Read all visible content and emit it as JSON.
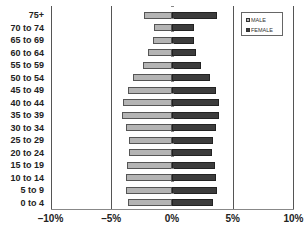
{
  "chart_data": {
    "type": "bar",
    "orientation": "horizontal",
    "subtype": "population-pyramid",
    "title": "",
    "xlabel": "",
    "ylabel": "",
    "xlim": [
      -10,
      10
    ],
    "x_ticks": [
      -10,
      -5,
      0,
      5,
      10
    ],
    "x_tick_labels": [
      "–10%",
      "–5%",
      "0%",
      "5%",
      "10%"
    ],
    "grid": {
      "vertical": true,
      "positions": [
        -10,
        -5,
        5
      ]
    },
    "legend_position": "top-right",
    "categories": [
      "75+",
      "70 to 74",
      "65 to 69",
      "60 to 64",
      "55 to 59",
      "50 to 54",
      "45 to 49",
      "40 to 44",
      "35 to 39",
      "30 to 34",
      "25 to 29",
      "20 to 24",
      "15 to 19",
      "10 to 14",
      "5 to 9",
      "0 to 4"
    ],
    "series": [
      {
        "name": "MALE",
        "color": "#b4b4b4",
        "side": "left",
        "values": [
          2.3,
          1.5,
          1.6,
          2.0,
          2.4,
          3.2,
          3.6,
          4.0,
          4.1,
          3.8,
          3.5,
          3.5,
          3.7,
          3.8,
          3.8,
          3.6
        ]
      },
      {
        "name": "FEMALE",
        "color": "#3c3c3c",
        "side": "right",
        "values": [
          3.7,
          1.8,
          1.8,
          2.0,
          2.4,
          3.1,
          3.6,
          3.9,
          3.9,
          3.6,
          3.4,
          3.3,
          3.5,
          3.6,
          3.7,
          3.4
        ]
      }
    ]
  },
  "legend": {
    "male_label": "MALE",
    "female_label": "FEMALE"
  }
}
